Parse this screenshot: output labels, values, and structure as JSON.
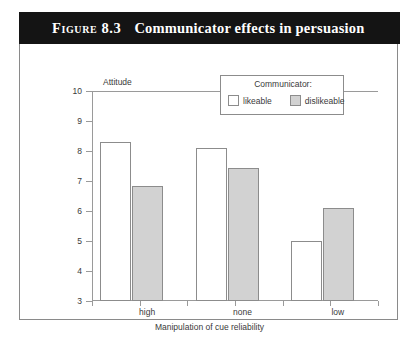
{
  "figure": {
    "number": "Figure 8.3",
    "title": "Communicator effects in persuasion"
  },
  "legend": {
    "title": "Communicator:",
    "items": [
      {
        "label": "likeable",
        "color": "#ffffff"
      },
      {
        "label": "dislikeable",
        "color": "#d2d2d2"
      }
    ]
  },
  "chart_data": {
    "type": "bar",
    "title": "Communicator effects in persuasion",
    "categories": [
      "high",
      "none",
      "low"
    ],
    "series": [
      {
        "name": "likeable",
        "color": "#ffffff",
        "values": [
          8.3,
          8.1,
          5.0
        ]
      },
      {
        "name": "dislikeable",
        "color": "#d2d2d2",
        "values": [
          6.85,
          7.45,
          6.1
        ]
      }
    ],
    "xlabel": "Manipulation of cue reliability",
    "ylabel": "Attitude",
    "ylim": [
      3,
      10
    ],
    "yticks": [
      3,
      4,
      5,
      6,
      7,
      8,
      9,
      10
    ],
    "ytick_labels": [
      "3",
      "4",
      "5",
      "6",
      "7",
      "8",
      "9",
      "10"
    ],
    "grid": false,
    "legend_position": "top-right"
  }
}
